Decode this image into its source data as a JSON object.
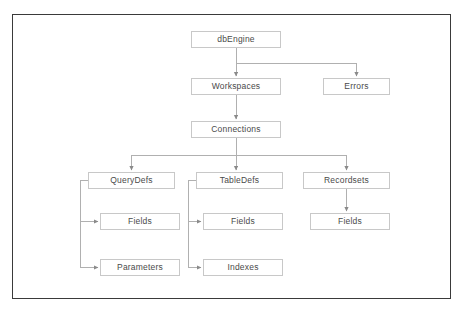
{
  "diagram": {
    "frame": {
      "x": 12,
      "y": 14,
      "width": 439,
      "height": 285,
      "border_color": "#3a3a3a"
    },
    "style": {
      "box_border_color": "#c8c8c8",
      "box_fill_color": "#ffffff",
      "text_color": "#4a4a4a",
      "connector_color": "#b0b0b0",
      "arrow_color": "#8a8a8a",
      "background_color": "#ffffff"
    },
    "nodes": [
      {
        "id": "dbengine",
        "label": "dbEngine",
        "x": 191,
        "y": 31,
        "width": 90,
        "height": 17
      },
      {
        "id": "workspaces",
        "label": "Workspaces",
        "x": 191,
        "y": 78,
        "width": 90,
        "height": 17
      },
      {
        "id": "errors",
        "label": "Errors",
        "x": 323,
        "y": 78,
        "width": 67,
        "height": 17
      },
      {
        "id": "connections",
        "label": "Connections",
        "x": 191,
        "y": 121,
        "width": 90,
        "height": 17
      },
      {
        "id": "querydefs",
        "label": "QueryDefs",
        "x": 88,
        "y": 172,
        "width": 87,
        "height": 17
      },
      {
        "id": "tabledefs",
        "label": "TableDefs",
        "x": 196,
        "y": 172,
        "width": 87,
        "height": 17
      },
      {
        "id": "recordsets",
        "label": "Recordsets",
        "x": 303,
        "y": 172,
        "width": 87,
        "height": 17
      },
      {
        "id": "query-fields",
        "label": "Fields",
        "x": 100,
        "y": 213,
        "width": 80,
        "height": 17
      },
      {
        "id": "table-fields",
        "label": "Fields",
        "x": 203,
        "y": 213,
        "width": 80,
        "height": 17
      },
      {
        "id": "record-fields",
        "label": "Fields",
        "x": 310,
        "y": 213,
        "width": 80,
        "height": 17
      },
      {
        "id": "query-parameters",
        "label": "Parameters",
        "x": 100,
        "y": 259,
        "width": 80,
        "height": 17
      },
      {
        "id": "table-indexes",
        "label": "Indexes",
        "x": 203,
        "y": 259,
        "width": 80,
        "height": 17
      }
    ],
    "edges": [
      {
        "from": "dbengine",
        "to": "workspaces",
        "style": "elbow-down"
      },
      {
        "from": "dbengine",
        "to": "errors",
        "style": "elbow-down"
      },
      {
        "from": "workspaces",
        "to": "connections",
        "style": "straight-down"
      },
      {
        "from": "connections",
        "to": "querydefs",
        "style": "elbow-down"
      },
      {
        "from": "connections",
        "to": "tabledefs",
        "style": "straight-down"
      },
      {
        "from": "connections",
        "to": "recordsets",
        "style": "elbow-down"
      },
      {
        "from": "querydefs",
        "to": "query-fields",
        "style": "elbow-right"
      },
      {
        "from": "querydefs",
        "to": "query-parameters",
        "style": "elbow-right"
      },
      {
        "from": "tabledefs",
        "to": "table-fields",
        "style": "elbow-right"
      },
      {
        "from": "tabledefs",
        "to": "table-indexes",
        "style": "elbow-right"
      },
      {
        "from": "recordsets",
        "to": "record-fields",
        "style": "straight-down"
      }
    ]
  }
}
